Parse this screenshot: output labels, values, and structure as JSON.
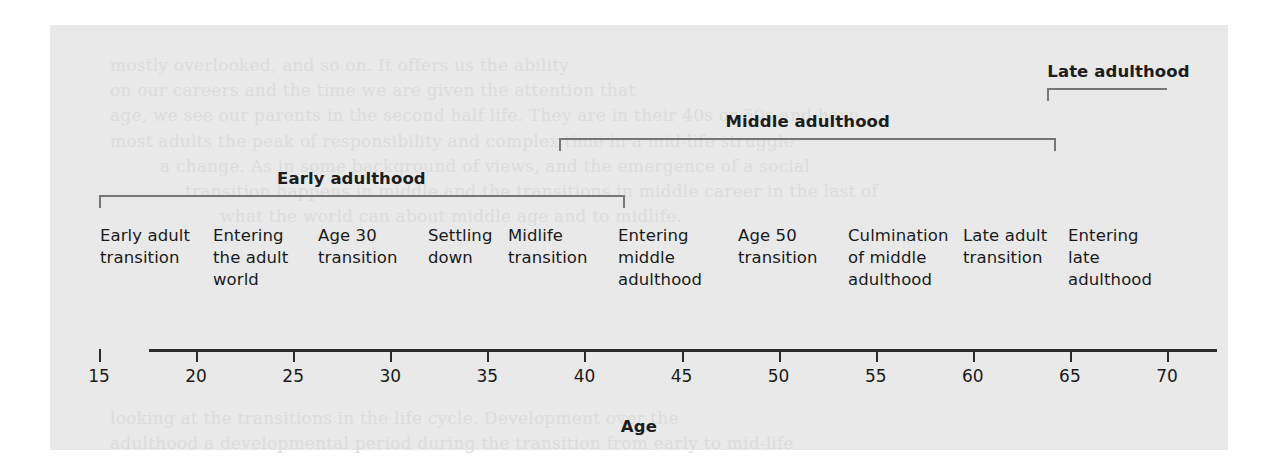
{
  "figure": {
    "axis_title": "Age",
    "background_color": "#e9e9e9",
    "axis_color": "#2b2b2b",
    "bracket_color": "#767676",
    "text_color": "#1a1a1a"
  },
  "eras": [
    {
      "label": "Early adulthood",
      "start_age": 15,
      "end_age": 42.1,
      "label_center_age": 28.0,
      "cap_left": true,
      "cap_right": true,
      "row": 2
    },
    {
      "label": "Middle adulthood",
      "start_age": 38.7,
      "end_age": 64.3,
      "label_center_age": 51.5,
      "cap_left": true,
      "cap_right": true,
      "row": 1
    },
    {
      "label": "Late adulthood",
      "start_age": 63.8,
      "end_age": 70.0,
      "label_center_age": 67.5,
      "cap_left": true,
      "cap_right": false,
      "row": 0
    }
  ],
  "stages": [
    {
      "label": "Early adult transition",
      "left_px": 100,
      "width_px": 108
    },
    {
      "label": "Entering the adult world",
      "left_px": 213,
      "width_px": 100
    },
    {
      "label": "Age 30 transition",
      "left_px": 318,
      "width_px": 100
    },
    {
      "label": "Settling down",
      "left_px": 428,
      "width_px": 75
    },
    {
      "label": "Midlife transition",
      "left_px": 508,
      "width_px": 100
    },
    {
      "label": "Entering middle adulthood",
      "left_px": 618,
      "width_px": 105
    },
    {
      "label": "Age 50 transition",
      "left_px": 738,
      "width_px": 100
    },
    {
      "label": "Culmination of middle adulthood",
      "left_px": 848,
      "width_px": 110
    },
    {
      "label": "Late adult transition",
      "left_px": 963,
      "width_px": 100
    },
    {
      "label": "Entering late adulthood",
      "left_px": 1068,
      "width_px": 95
    }
  ],
  "chart_data": {
    "type": "timeline",
    "title": "",
    "xlabel": "Age",
    "ylabel": "",
    "xlim": [
      15,
      70
    ],
    "xticks": [
      15,
      20,
      25,
      30,
      35,
      40,
      45,
      50,
      55,
      60,
      65,
      70
    ],
    "xtick_labels": [
      "15",
      "20",
      "25",
      "30",
      "35",
      "40",
      "45",
      "50",
      "55",
      "60",
      "65",
      "70"
    ],
    "grid": false,
    "legend": "none",
    "eras": [
      {
        "name": "Early adulthood",
        "start_age": 15,
        "end_age": 42
      },
      {
        "name": "Middle adulthood",
        "start_age": 39,
        "end_age": 64
      },
      {
        "name": "Late adulthood",
        "start_age": 64,
        "end_age": 70
      }
    ],
    "periods": [
      "Early adult transition",
      "Entering the adult world",
      "Age 30 transition",
      "Settling down",
      "Midlife transition",
      "Entering middle adulthood",
      "Age 50 transition",
      "Culmination of middle adulthood",
      "Late adult transition",
      "Entering late adulthood"
    ]
  },
  "bleed_text": [
    {
      "text": "mostly overlooked, and so on. It offers us the ability",
      "left": 60,
      "top": 30
    },
    {
      "text": "on our careers and the time we are given the attention that",
      "left": 60,
      "top": 55
    },
    {
      "text": "age, we see our parents in the second half life. They are in their 40s or 50s and have",
      "left": 60,
      "top": 80
    },
    {
      "text": "most adults the peak of responsibility and complex time in a mid-life struggle",
      "left": 60,
      "top": 106
    },
    {
      "text": "a change. As in some background of views, and the emergence of a social",
      "left": 110,
      "top": 131
    },
    {
      "text": "transition happens in middle and the transitions in middle career in the last of",
      "left": 135,
      "top": 156
    },
    {
      "text": "what the world can about middle age and to midlife.",
      "left": 170,
      "top": 181
    },
    {
      "text": "looking at the transitions in the life cycle. Development over the",
      "left": 60,
      "top": 383
    },
    {
      "text": "adulthood a developmental period during the transition from early to mid-life",
      "left": 60,
      "top": 408
    }
  ]
}
